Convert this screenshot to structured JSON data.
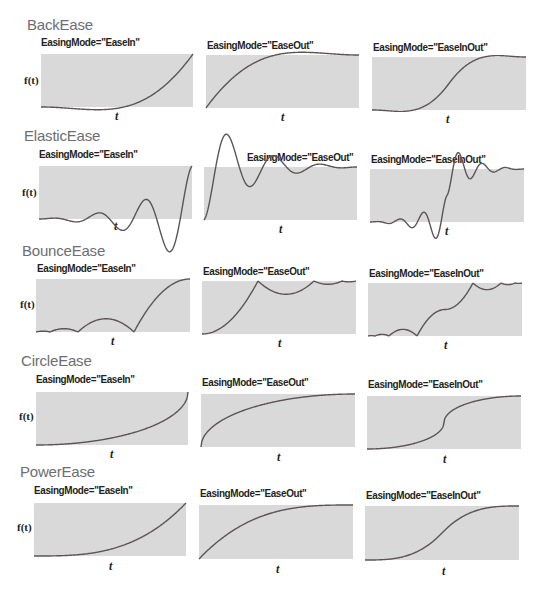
{
  "figure": {
    "y_axis_label": "f(t)",
    "x_axis_label": "t",
    "colors": {
      "plot_fill": "#d9d9d9",
      "curve": "#5b5557",
      "title": "#6d6e71",
      "label": "#231f20"
    }
  },
  "sections": [
    {
      "title": "BackEase",
      "ease": "back",
      "plots": [
        {
          "mode_label": "EasingMode=\"EaseIn\"",
          "mode": "in"
        },
        {
          "mode_label": "EasingMode=\"EaseOut\"",
          "mode": "out"
        },
        {
          "mode_label": "EasingMode=\"EaseInOut\"",
          "mode": "inout"
        }
      ]
    },
    {
      "title": "ElasticEase",
      "ease": "elastic",
      "plots": [
        {
          "mode_label": "EasingMode=\"EaseIn\"",
          "mode": "in"
        },
        {
          "mode_label": "EasingMode=\"EaseOut\"",
          "mode": "out"
        },
        {
          "mode_label": "EasingMode=\"EaseInOut\"",
          "mode": "inout"
        }
      ]
    },
    {
      "title": "BounceEase",
      "ease": "bounce",
      "plots": [
        {
          "mode_label": "EasingMode=\"EaseIn\"",
          "mode": "in"
        },
        {
          "mode_label": "EasingMode=\"EaseOut\"",
          "mode": "out"
        },
        {
          "mode_label": "EasingMode=\"EaseInOut\"",
          "mode": "inout"
        }
      ]
    },
    {
      "title": "CircleEase",
      "ease": "circle",
      "plots": [
        {
          "mode_label": "EasingMode=\"EaseIn\"",
          "mode": "in"
        },
        {
          "mode_label": "EasingMode=\"EaseOut\"",
          "mode": "out"
        },
        {
          "mode_label": "EasingMode=\"EaseInOut\"",
          "mode": "inout"
        }
      ]
    },
    {
      "title": "PowerEase",
      "ease": "power",
      "plots": [
        {
          "mode_label": "EasingMode=\"EaseIn\"",
          "mode": "in"
        },
        {
          "mode_label": "EasingMode=\"EaseOut\"",
          "mode": "out"
        },
        {
          "mode_label": "EasingMode=\"EaseInOut\"",
          "mode": "inout"
        }
      ]
    }
  ],
  "chart_data": {
    "type": "line",
    "xlabel": "t",
    "ylabel": "f(t)",
    "x_range": [
      0,
      1
    ],
    "y_range": [
      0,
      1
    ],
    "grid": false,
    "legend": "none",
    "panels": [
      {
        "ease": "BackEase",
        "mode": "EaseIn",
        "min_y": -0.1,
        "end_y": 1
      },
      {
        "ease": "BackEase",
        "mode": "EaseOut",
        "max_y": 1.1,
        "end_y": 1
      },
      {
        "ease": "BackEase",
        "mode": "EaseInOut",
        "min_y": -0.1,
        "max_y": 1.1
      },
      {
        "ease": "ElasticEase",
        "mode": "EaseIn",
        "min_y": -0.37,
        "oscillations": 3
      },
      {
        "ease": "ElasticEase",
        "mode": "EaseOut",
        "max_y": 1.37,
        "oscillations": 3
      },
      {
        "ease": "ElasticEase",
        "mode": "EaseInOut",
        "min_y": -0.37,
        "max_y": 1.37
      },
      {
        "ease": "BounceEase",
        "mode": "EaseIn",
        "bounces": 3
      },
      {
        "ease": "BounceEase",
        "mode": "EaseOut",
        "bounces": 3
      },
      {
        "ease": "BounceEase",
        "mode": "EaseInOut",
        "bounces": 3
      },
      {
        "ease": "CircleEase",
        "mode": "EaseIn"
      },
      {
        "ease": "CircleEase",
        "mode": "EaseOut"
      },
      {
        "ease": "CircleEase",
        "mode": "EaseInOut"
      },
      {
        "ease": "PowerEase",
        "mode": "EaseIn",
        "power": 3
      },
      {
        "ease": "PowerEase",
        "mode": "EaseOut",
        "power": 3
      },
      {
        "ease": "PowerEase",
        "mode": "EaseInOut",
        "power": 3
      }
    ]
  }
}
